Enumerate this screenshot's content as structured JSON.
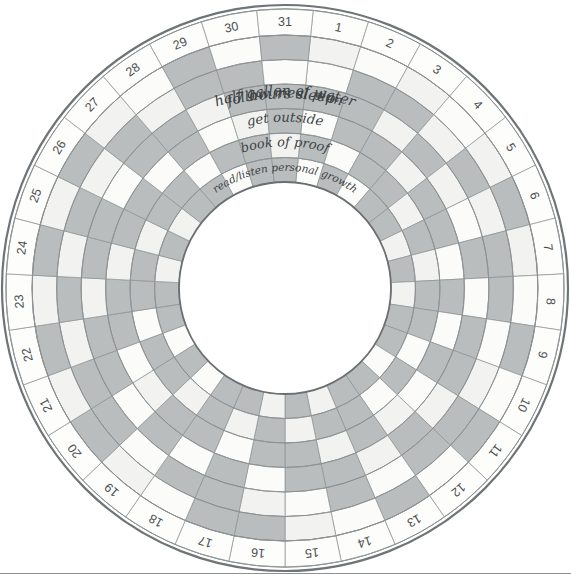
{
  "title": "HABIT",
  "geometry": {
    "cx": 285,
    "cy": 288,
    "outer_radius": 283,
    "rim_outer": 279,
    "rim_inner": 253,
    "inner_hole_radius": 106,
    "sectors": 31,
    "rings": 6,
    "start_angle_deg": -84.2,
    "sweep_deg": 360
  },
  "colors": {
    "filled": "#b9bdbd",
    "empty": "#fbfbfa",
    "alt_empty": "#f2f3f1",
    "grid": "#8b9092",
    "outer_border": "#6f7476",
    "ink": "#3c4243",
    "title": "#4a4e4f",
    "page_rule": "#8e9192",
    "background": "#ffffff"
  },
  "habits": [
    {
      "index": 0,
      "label": "7 hours sleep"
    },
    {
      "index": 1,
      "label": "half gallon of water"
    },
    {
      "index": 2,
      "label": "follow meal plan"
    },
    {
      "index": 3,
      "label": "get outside"
    },
    {
      "index": 4,
      "label": "book of proof"
    },
    {
      "index": 5,
      "label": "read/listen personal growth"
    }
  ],
  "days": [
    1,
    2,
    3,
    4,
    5,
    6,
    7,
    8,
    9,
    10,
    11,
    12,
    13,
    14,
    15,
    16,
    17,
    18,
    19,
    20,
    21,
    22,
    23,
    24,
    25,
    26,
    27,
    28,
    29,
    30,
    31
  ],
  "chart_data": {
    "type": "heatmap",
    "title": "HABIT",
    "layout": "polar-grid",
    "xlabel": "Day of month",
    "ylabel": "Habit",
    "categories": [
      1,
      2,
      3,
      4,
      5,
      6,
      7,
      8,
      9,
      10,
      11,
      12,
      13,
      14,
      15,
      16,
      17,
      18,
      19,
      20,
      21,
      22,
      23,
      24,
      25,
      26,
      27,
      28,
      29,
      30,
      31
    ],
    "legend": {
      "filled": "completed",
      "empty": "not completed"
    },
    "grid": true,
    "series": [
      {
        "name": "7 hours sleep",
        "values": [
          0,
          0,
          0,
          0,
          0,
          1,
          0,
          0,
          1,
          0,
          1,
          0,
          1,
          0,
          0,
          1,
          1,
          0,
          0,
          1,
          0,
          1,
          0,
          1,
          0,
          1,
          0,
          0,
          1,
          0,
          1
        ]
      },
      {
        "name": "half gallon of water",
        "values": [
          0,
          1,
          1,
          0,
          1,
          0,
          1,
          1,
          0,
          0,
          1,
          1,
          0,
          1,
          0,
          0,
          1,
          1,
          0,
          1,
          1,
          0,
          1,
          0,
          1,
          0,
          1,
          0,
          1,
          1,
          0
        ]
      },
      {
        "name": "follow meal plan",
        "values": [
          1,
          1,
          0,
          1,
          0,
          0,
          1,
          0,
          1,
          1,
          0,
          1,
          0,
          1,
          1,
          0,
          1,
          0,
          1,
          0,
          1,
          1,
          0,
          1,
          1,
          0,
          1,
          1,
          0,
          1,
          1
        ]
      },
      {
        "name": "get outside",
        "values": [
          0,
          1,
          1,
          0,
          1,
          1,
          0,
          1,
          0,
          1,
          0,
          0,
          1,
          0,
          1,
          1,
          0,
          1,
          1,
          0,
          0,
          1,
          1,
          0,
          1,
          1,
          0,
          1,
          0,
          0,
          1
        ]
      },
      {
        "name": "book of proof",
        "values": [
          1,
          0,
          1,
          1,
          0,
          1,
          0,
          1,
          1,
          0,
          1,
          0,
          1,
          1,
          0,
          1,
          0,
          1,
          0,
          1,
          1,
          0,
          1,
          1,
          0,
          1,
          1,
          0,
          1,
          1,
          0
        ]
      },
      {
        "name": "read/listen personal growth",
        "values": [
          0,
          1,
          0,
          1,
          1,
          0,
          1,
          0,
          1,
          1,
          0,
          1,
          1,
          0,
          1,
          0,
          1,
          1,
          0,
          1,
          0,
          1,
          1,
          0,
          1,
          0,
          1,
          1,
          0,
          1,
          1
        ]
      }
    ]
  }
}
